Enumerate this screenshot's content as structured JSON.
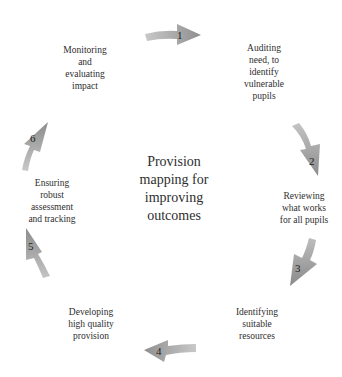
{
  "diagram": {
    "title": "Provision\nmapping for\nimproving\noutcomes",
    "steps": [
      {
        "number": "1",
        "label": "Auditing\nneed, to\nidentify\nvulnerable\npupils"
      },
      {
        "number": "2",
        "label": "Reviewing\nwhat works\nfor all pupils"
      },
      {
        "number": "3",
        "label": "Identifying\nsuitable\nresources"
      },
      {
        "number": "4",
        "label": "Developing\nhigh quality\nprovision"
      },
      {
        "number": "5",
        "label": "Ensuring\nrobust\nassessment\nand tracking"
      },
      {
        "number": "6",
        "label": "Monitoring\nand\nevaluating\nimpact"
      }
    ],
    "colors": {
      "arrow_fill": "#a9a9a9",
      "arrow_dark": "#8c8c8c",
      "text": "#2e2e2e",
      "background": "#ffffff"
    }
  }
}
